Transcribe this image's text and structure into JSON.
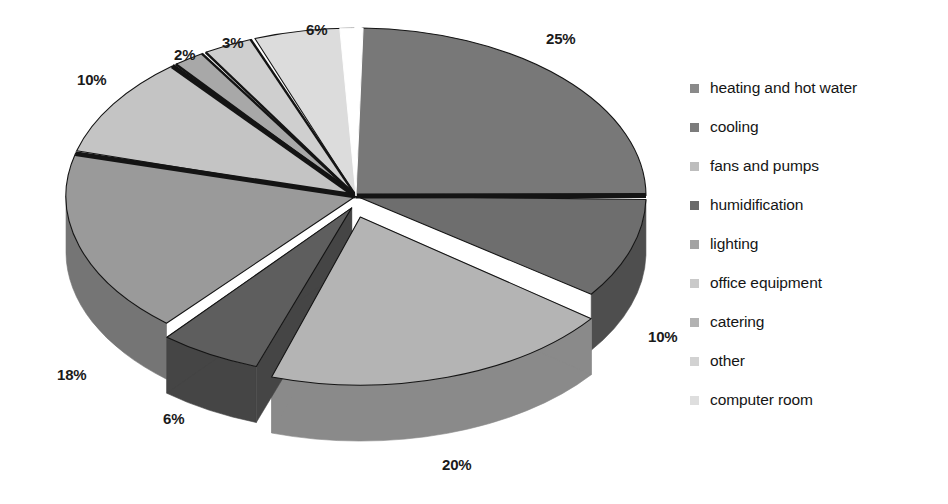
{
  "chart_data": {
    "type": "pie",
    "title": "",
    "subtitle": "",
    "xlabel": "",
    "ylabel": "",
    "legend_position": "right",
    "grid": false,
    "style": "3d-exploded-grayscale",
    "categories": [
      "heating and hot water",
      " cooling",
      "fans and pumps",
      "humidification",
      "lighting",
      "office equipment",
      "catering",
      " other",
      "computer room"
    ],
    "values": [
      25,
      10,
      20,
      6,
      18,
      10,
      2,
      3,
      6
    ],
    "value_labels": [
      "25%",
      "10%",
      "20%",
      "6%",
      "18%",
      "10%",
      "2%",
      "3%",
      "6%"
    ],
    "colors": [
      "#787878",
      "#6e6e6e",
      "#b4b4b4",
      "#5e5e5e",
      "#9a9a9a",
      "#c4c4c4",
      "#a8a8a8",
      "#cfcfcf",
      "#dcdcdc"
    ],
    "slices": [
      {
        "label": "heating and hot water",
        "value": 25,
        "value_label": "25%",
        "color": "#787878",
        "side_color": "#5a5a5a"
      },
      {
        "label": " cooling",
        "value": 10,
        "value_label": "10%",
        "color": "#6e6e6e",
        "side_color": "#4e4e4e"
      },
      {
        "label": "fans and pumps",
        "value": 20,
        "value_label": "20%",
        "color": "#b4b4b4",
        "side_color": "#8a8a8a"
      },
      {
        "label": "humidification",
        "value": 6,
        "value_label": "6%",
        "color": "#5e5e5e",
        "side_color": "#454545"
      },
      {
        "label": "lighting",
        "value": 18,
        "value_label": "18%",
        "color": "#9a9a9a",
        "side_color": "#757575"
      },
      {
        "label": "office equipment",
        "value": 10,
        "value_label": "10%",
        "color": "#c4c4c4",
        "side_color": "#989898"
      },
      {
        "label": "catering",
        "value": 2,
        "value_label": "2%",
        "color": "#a8a8a8",
        "side_color": "#858585"
      },
      {
        "label": " other",
        "value": 3,
        "value_label": "3%",
        "color": "#cfcfcf",
        "side_color": "#a0a0a0"
      },
      {
        "label": "computer room",
        "value": 6,
        "value_label": "6%",
        "color": "#dcdcdc",
        "side_color": "#aeaeae"
      }
    ]
  },
  "pie": {
    "labels": [
      {
        "text": "25%",
        "x": 546,
        "y": 30
      },
      {
        "text": "10%",
        "x": 648,
        "y": 328
      },
      {
        "text": "20%",
        "x": 442,
        "y": 456
      },
      {
        "text": "6%",
        "x": 163,
        "y": 410
      },
      {
        "text": "18%",
        "x": 57,
        "y": 366
      },
      {
        "text": "10%",
        "x": 77,
        "y": 71
      },
      {
        "text": "2%",
        "x": 174,
        "y": 46
      },
      {
        "text": "3%",
        "x": 222,
        "y": 34
      },
      {
        "text": "6%",
        "x": 306,
        "y": 21
      }
    ]
  },
  "legend": {
    "items": [
      {
        "label": "heating and hot water",
        "color": "#8a8a8a"
      },
      {
        "label": " cooling",
        "color": "#7c7c7c"
      },
      {
        "label": "fans and pumps",
        "color": "#bdbdbd"
      },
      {
        "label": "humidification",
        "color": "#6a6a6a"
      },
      {
        "label": "lighting",
        "color": "#a3a3a3"
      },
      {
        "label": "office equipment",
        "color": "#c9c9c9"
      },
      {
        "label": "catering",
        "color": "#b2b2b2"
      },
      {
        "label": " other",
        "color": "#d2d2d2"
      },
      {
        "label": "computer room",
        "color": "#dedede"
      }
    ]
  },
  "colors": {
    "background": "#ffffff",
    "text": "#151515",
    "slice_divider": "#141414"
  }
}
